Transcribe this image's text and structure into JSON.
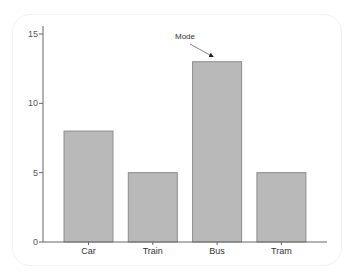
{
  "chart_data": {
    "type": "bar",
    "title": "",
    "xlabel": "",
    "ylabel": "",
    "categories": [
      "Car",
      "Train",
      "Bus",
      "Tram"
    ],
    "values": [
      8,
      5,
      13,
      5
    ],
    "ylim": [
      0,
      15.6
    ],
    "yticks": [
      0,
      5,
      10,
      15
    ],
    "grid": false,
    "legend": null,
    "annotations": [
      {
        "text": "Mode",
        "target_category": "Bus",
        "arrow": true
      }
    ],
    "colors": {
      "bar_fill": "#b9b9b9",
      "bar_stroke": "#8c8c8c",
      "axis": "#666666"
    }
  }
}
